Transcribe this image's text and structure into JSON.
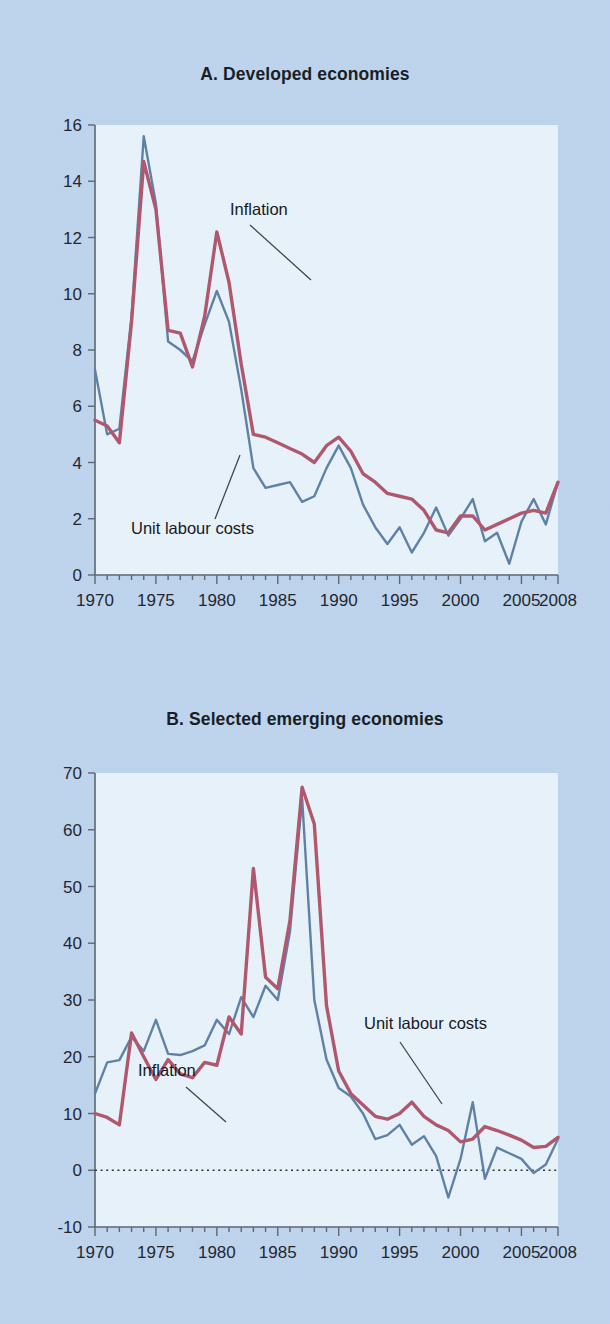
{
  "figure": {
    "background_color": "#bdd5ee",
    "plot_background_color": "#e9f3fb"
  },
  "panels": {
    "a": {
      "title": "A. Developed economies",
      "annotations": {
        "inflation": "Inflation",
        "unit_labour_costs": "Unit labour costs"
      }
    },
    "b": {
      "title": "B. Selected emerging economies",
      "annotations": {
        "inflation": "Inflation",
        "unit_labour_costs": "Unit labour costs"
      }
    }
  },
  "chart_data": [
    {
      "type": "line",
      "title": "A. Developed economies",
      "xlabel": "",
      "ylabel": "",
      "xlim": [
        1970,
        2008
      ],
      "ylim": [
        0,
        16
      ],
      "ytick_step": 2,
      "yticks": [
        0,
        2,
        4,
        6,
        8,
        10,
        12,
        14,
        16
      ],
      "ytick_labels": [
        "0",
        "2",
        "4",
        "6",
        "8",
        "10",
        "12",
        "14",
        "16"
      ],
      "xticks": [
        1970,
        1975,
        1980,
        1985,
        1990,
        1995,
        2000,
        2005,
        2008
      ],
      "xtick_labels": [
        "1970",
        "1975",
        "1980",
        "1985",
        "1990",
        "1995",
        "2000",
        "2005",
        "2008"
      ],
      "minor_xtick_interval": 1,
      "grid": false,
      "legend": "none (inline annotations with leader lines)",
      "zero_line": false,
      "x": [
        1970,
        1971,
        1972,
        1973,
        1974,
        1975,
        1976,
        1977,
        1978,
        1979,
        1980,
        1981,
        1982,
        1983,
        1984,
        1985,
        1986,
        1987,
        1988,
        1989,
        1990,
        1991,
        1992,
        1993,
        1994,
        1995,
        1996,
        1997,
        1998,
        1999,
        2000,
        2001,
        2002,
        2003,
        2004,
        2005,
        2006,
        2007,
        2008
      ],
      "series": [
        {
          "name": "Inflation",
          "color": "#b0566c",
          "values": [
            5.5,
            5.3,
            4.7,
            9.0,
            14.7,
            13.0,
            8.7,
            8.6,
            7.4,
            9.2,
            12.2,
            10.4,
            7.5,
            5.0,
            4.9,
            4.7,
            4.5,
            4.3,
            4.0,
            4.6,
            4.9,
            4.4,
            3.6,
            3.3,
            2.9,
            2.8,
            2.7,
            2.3,
            1.6,
            1.5,
            2.1,
            2.1,
            1.6,
            1.8,
            2.0,
            2.2,
            2.3,
            2.2,
            3.3
          ]
        },
        {
          "name": "Unit labour costs",
          "color": "#5d80a7",
          "values": [
            7.3,
            5.0,
            5.2,
            9.2,
            15.6,
            13.2,
            8.3,
            8.0,
            7.6,
            8.9,
            10.1,
            9.0,
            6.6,
            3.8,
            3.1,
            3.2,
            3.3,
            2.6,
            2.8,
            3.8,
            4.6,
            3.8,
            2.5,
            1.7,
            1.1,
            1.7,
            0.8,
            1.5,
            2.4,
            1.4,
            2.0,
            2.7,
            1.2,
            1.5,
            0.4,
            1.9,
            2.7,
            1.8,
            3.3
          ]
        }
      ]
    },
    {
      "type": "line",
      "title": "B. Selected emerging economies",
      "xlabel": "",
      "ylabel": "",
      "xlim": [
        1970,
        2008
      ],
      "ylim": [
        -10,
        70
      ],
      "ytick_step": 10,
      "yticks": [
        -10,
        0,
        10,
        20,
        30,
        40,
        50,
        60,
        70
      ],
      "ytick_labels": [
        "-10",
        "0",
        "10",
        "20",
        "30",
        "40",
        "50",
        "60",
        "70"
      ],
      "xticks": [
        1970,
        1975,
        1980,
        1985,
        1990,
        1995,
        2000,
        2005,
        2008
      ],
      "xtick_labels": [
        "1970",
        "1975",
        "1980",
        "1985",
        "1990",
        "1995",
        "2000",
        "2005",
        "2008"
      ],
      "minor_xtick_interval": 1,
      "grid": false,
      "legend": "none (inline annotations with leader lines)",
      "zero_line": true,
      "zero_line_style": "dotted",
      "x": [
        1970,
        1971,
        1972,
        1973,
        1974,
        1975,
        1976,
        1977,
        1978,
        1979,
        1980,
        1981,
        1982,
        1983,
        1984,
        1985,
        1986,
        1987,
        1988,
        1989,
        1990,
        1991,
        1992,
        1993,
        1994,
        1995,
        1996,
        1997,
        1998,
        1999,
        2000,
        2001,
        2002,
        2003,
        2004,
        2005,
        2006,
        2007,
        2008
      ],
      "series": [
        {
          "name": "Inflation",
          "color": "#b0566c",
          "values": [
            10.0,
            9.3,
            8.0,
            24.2,
            20.0,
            16.0,
            19.5,
            17.0,
            16.3,
            19.0,
            18.5,
            27.0,
            24.0,
            53.2,
            34.0,
            32.0,
            44.0,
            67.5,
            61.0,
            29.0,
            17.5,
            13.5,
            11.5,
            9.5,
            9.0,
            10.0,
            12.0,
            9.5,
            8.0,
            7.0,
            5.0,
            5.5,
            7.7,
            7.0,
            6.2,
            5.3,
            4.0,
            4.2,
            5.8
          ]
        },
        {
          "name": "Unit labour costs",
          "color": "#5d80a7",
          "values": [
            13.5,
            19.0,
            19.4,
            23.5,
            21.0,
            26.5,
            20.5,
            20.3,
            21.0,
            22.0,
            26.5,
            24.0,
            30.5,
            27.0,
            32.5,
            30.0,
            42.0,
            65.5,
            30.0,
            19.5,
            14.5,
            13.0,
            10.0,
            5.5,
            6.2,
            8.0,
            4.5,
            6.0,
            2.5,
            -4.8,
            2.0,
            12.0,
            -1.5,
            4.0,
            3.0,
            2.0,
            -0.5,
            1.0,
            5.5
          ]
        }
      ]
    }
  ]
}
